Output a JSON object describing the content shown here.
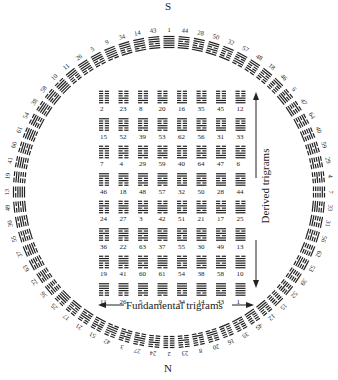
{
  "diagram": {
    "directions": {
      "top": "S",
      "bottom": "N"
    },
    "outer_ring": {
      "center": [
        169,
        192
      ],
      "radius": 150,
      "start_label_top": "S",
      "right_side_top_to_bottom": [
        1,
        44,
        28,
        50,
        32,
        57,
        48,
        18,
        46,
        6,
        47,
        64,
        40,
        59,
        29,
        4,
        7,
        33,
        31,
        56,
        62,
        53,
        39,
        52,
        15,
        12,
        45,
        35,
        16,
        20,
        8,
        23,
        2
      ],
      "left_side_top_to_bottom": [
        43,
        14,
        34,
        9,
        5,
        26,
        11,
        10,
        58,
        38,
        54,
        61,
        60,
        41,
        19,
        13,
        49,
        30,
        55,
        37,
        63,
        22,
        36,
        25,
        17,
        21,
        51,
        42,
        3,
        27,
        24
      ]
    },
    "inner_grid": {
      "rows": [
        [
          2,
          23,
          8,
          20,
          16,
          35,
          45,
          12
        ],
        [
          15,
          52,
          39,
          53,
          62,
          56,
          31,
          33
        ],
        [
          7,
          4,
          29,
          59,
          40,
          64,
          47,
          6
        ],
        [
          46,
          18,
          48,
          57,
          32,
          50,
          28,
          44
        ],
        [
          24,
          27,
          3,
          42,
          51,
          21,
          17,
          25
        ],
        [
          36,
          22,
          63,
          37,
          55,
          30,
          49,
          13
        ],
        [
          19,
          41,
          60,
          61,
          54,
          38,
          58,
          10
        ],
        [
          11,
          26,
          5,
          9,
          34,
          14,
          43,
          1
        ]
      ]
    },
    "labels": {
      "fundamental": "Fundamental trigrams",
      "derived": "Derived trigrams"
    },
    "colors": {
      "ink": "#222222",
      "background": "#ffffff"
    }
  }
}
